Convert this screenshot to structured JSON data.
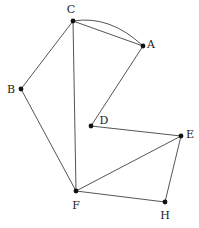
{
  "figure": {
    "kind": "undirected-graph-diagram",
    "width": 199,
    "height": 228,
    "background_color": "#ffffff",
    "edge_color": "#555555",
    "vertex_color": "#111111",
    "label_color": "#1a1a1a"
  },
  "graph": {
    "vertices": [
      {
        "id": "A",
        "label": "A",
        "x": 143,
        "y": 46,
        "label_x": 151,
        "label_y": 44
      },
      {
        "id": "B",
        "label": "B",
        "x": 21,
        "y": 89,
        "label_x": 11,
        "label_y": 89
      },
      {
        "id": "C",
        "label": "C",
        "x": 73,
        "y": 21,
        "label_x": 71,
        "label_y": 9
      },
      {
        "id": "D",
        "label": "D",
        "x": 91,
        "y": 126,
        "label_x": 104,
        "label_y": 120
      },
      {
        "id": "E",
        "label": "E",
        "x": 181,
        "y": 136,
        "label_x": 190,
        "label_y": 134
      },
      {
        "id": "F",
        "label": "F",
        "x": 76,
        "y": 191,
        "label_x": 76,
        "label_y": 205
      },
      {
        "id": "H",
        "label": "H",
        "x": 165,
        "y": 202,
        "label_x": 165,
        "label_y": 215
      }
    ],
    "edges": [
      {
        "from": "C",
        "to": "A",
        "shape": "straight"
      },
      {
        "from": "C",
        "to": "A",
        "shape": "curved",
        "bow_x": 110,
        "bow_y": 15
      },
      {
        "from": "C",
        "to": "B",
        "shape": "straight"
      },
      {
        "from": "C",
        "to": "F",
        "shape": "straight"
      },
      {
        "from": "B",
        "to": "F",
        "shape": "straight"
      },
      {
        "from": "A",
        "to": "D",
        "shape": "straight"
      },
      {
        "from": "D",
        "to": "E",
        "shape": "straight"
      },
      {
        "from": "E",
        "to": "F",
        "shape": "straight"
      },
      {
        "from": "E",
        "to": "H",
        "shape": "straight"
      },
      {
        "from": "F",
        "to": "H",
        "shape": "straight"
      }
    ]
  }
}
